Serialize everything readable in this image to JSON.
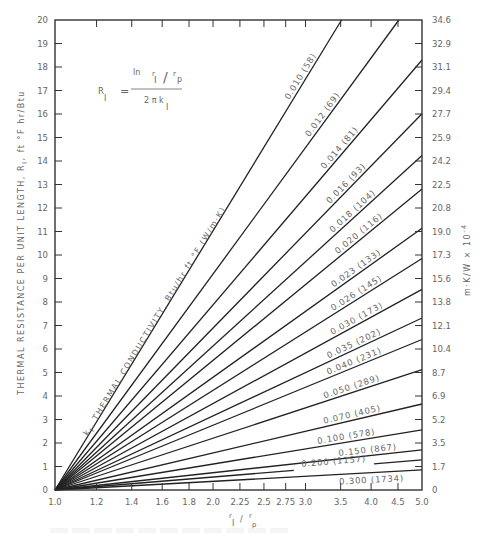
{
  "chart_data": {
    "type": "line",
    "title": "",
    "formula": {
      "lhs": "R",
      "lhs_sub": "I",
      "equals": "=",
      "num_ln": "ln",
      "num_r1": "r",
      "num_r1_sub": "I",
      "num_slash": "/",
      "num_rp": "r",
      "num_rp_sub": "p",
      "den": "2 π k",
      "den_sub": "I",
      "expression": "R_I = ln(r_I/r_p) / (2π k_I)"
    },
    "xlabel": "r_I / r_p",
    "xlabel_parts": {
      "r": "r",
      "sub1": "I",
      "slash": "/",
      "r2": "r",
      "sub2": "p"
    },
    "ylabel": "THERMAL RESISTANCE PER UNIT LENGTH, R_I, ft °F hr/Btu",
    "ylabel_parts": {
      "main": "THERMAL RESISTANCE PER UNIT LENGTH, R",
      "sub": "I",
      "tail": ", ft °F hr/Btu"
    },
    "y2label": "m·K/W × 10⁻⁴",
    "y2label_parts": {
      "main": "m·K/W × 10",
      "exp": "-4"
    },
    "curve_family_label": "k_I, THERMAL CONDUCTIVITY, Btu/hr ft °F (W/m·K)",
    "curve_family_label_parts": {
      "k": "k",
      "sub": "I",
      "text": ", THERMAL CONDUCTIVITY, Btu/hr ft °F (W/m·K)"
    },
    "x_scale": "log",
    "xlim": [
      1.0,
      5.0
    ],
    "ylim": [
      0,
      20
    ],
    "x_ticks": [
      1.0,
      1.2,
      1.4,
      1.6,
      1.8,
      2.0,
      2.25,
      2.5,
      2.75,
      3.0,
      3.5,
      4.0,
      4.5,
      5.0
    ],
    "x_tick_labels": [
      "1.0",
      "1.2",
      "1.4",
      "1.6",
      "1.8",
      "2.0",
      "2.25",
      "2.5",
      "2.75",
      "3.0",
      "3.5",
      "4.0",
      "4.5",
      "5.0"
    ],
    "y_ticks": [
      0,
      1,
      2,
      3,
      4,
      5,
      6,
      7,
      8,
      9,
      10,
      11,
      12,
      13,
      14,
      15,
      16,
      17,
      18,
      19,
      20
    ],
    "y2_tick_labels": [
      "0",
      "1.7",
      "3.5",
      "5.2",
      "6.9",
      "8.7",
      "10.4",
      "12.1",
      "13.8",
      "15.6",
      "17.3",
      "19.0",
      "20.8",
      "22.5",
      "24.2",
      "25.9",
      "27.7",
      "29.4",
      "31.1",
      "32.9",
      "34.6"
    ],
    "grid": false,
    "series": [
      {
        "k_btu": 0.01,
        "k_si": 58,
        "label": "0.010  (58)",
        "label_x": 3.0
      },
      {
        "k_btu": 0.012,
        "k_si": 69,
        "label": "0.012  (69)",
        "label_x": 3.3
      },
      {
        "k_btu": 0.014,
        "k_si": 81,
        "label": "0.014  (81)",
        "label_x": 3.55
      },
      {
        "k_btu": 0.016,
        "k_si": 93,
        "label": "0.016  (93)",
        "label_x": 3.65
      },
      {
        "k_btu": 0.018,
        "k_si": 104,
        "label": "0.018  (104)",
        "label_x": 3.75
      },
      {
        "k_btu": 0.02,
        "k_si": 116,
        "label": "0.020  (116)",
        "label_x": 3.85
      },
      {
        "k_btu": 0.023,
        "k_si": 133,
        "label": "0.023  (133)",
        "label_x": 3.8
      },
      {
        "k_btu": 0.026,
        "k_si": 145,
        "label": "0.026  (145)",
        "label_x": 3.8
      },
      {
        "k_btu": 0.03,
        "k_si": 173,
        "label": "0.030  (173)",
        "label_x": 3.8
      },
      {
        "k_btu": 0.035,
        "k_si": 202,
        "label": "0.035  (202)",
        "label_x": 3.75
      },
      {
        "k_btu": 0.04,
        "k_si": 231,
        "label": "0.040  (231)",
        "label_x": 3.75
      },
      {
        "k_btu": 0.05,
        "k_si": 289,
        "label": "0.050  (289)",
        "label_x": 3.7
      },
      {
        "k_btu": 0.07,
        "k_si": 405,
        "label": "0.070  (405)",
        "label_x": 3.7
      },
      {
        "k_btu": 0.1,
        "k_si": 578,
        "label": "0.100  (578)",
        "label_x": 3.6
      },
      {
        "k_btu": 0.15,
        "k_si": 867,
        "label": "0.150  (867)",
        "label_x": 3.95
      },
      {
        "k_btu": 0.2,
        "k_si": 1157,
        "label": "0.200  (1157)",
        "label_x": 3.4,
        "gap": [
          2.85,
          4.05
        ]
      },
      {
        "k_btu": 0.3,
        "k_si": 1734,
        "label": "0.300  (1734)",
        "label_x": 4.0,
        "below": true
      }
    ]
  }
}
